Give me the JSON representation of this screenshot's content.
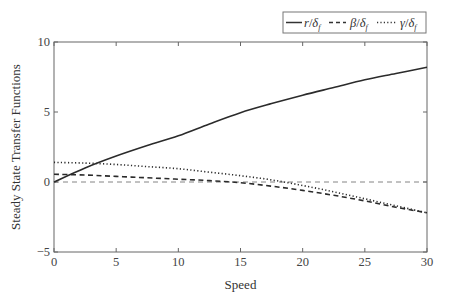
{
  "chart_data": {
    "type": "line",
    "title": "",
    "xlabel": "Speed",
    "ylabel": "Steady State Transfer Functions",
    "xlim": [
      0,
      30
    ],
    "ylim": [
      -5,
      10
    ],
    "xticks": [
      0,
      5,
      10,
      15,
      20,
      25,
      30
    ],
    "yticks": [
      -5,
      0,
      5,
      10
    ],
    "xtick_labels": [
      "0",
      "5",
      "10",
      "15",
      "20",
      "25",
      "30"
    ],
    "ytick_labels": [
      "−5",
      "0",
      "5",
      "10"
    ],
    "grid": false,
    "legend_position": "top-right, above plot",
    "reference_line": {
      "y": 0,
      "style": "dashed-thin"
    },
    "x": [
      0,
      2.5,
      5,
      7.5,
      10,
      12.5,
      15,
      17.5,
      20,
      22.5,
      25,
      27.5,
      30
    ],
    "series": [
      {
        "name": "r/δf",
        "style": "solid",
        "values": [
          0,
          1.0,
          1.85,
          2.6,
          3.3,
          4.15,
          4.95,
          5.6,
          6.2,
          6.75,
          7.3,
          7.75,
          8.2
        ]
      },
      {
        "name": "β/δf",
        "style": "dashed",
        "values": [
          0.55,
          0.5,
          0.4,
          0.3,
          0.2,
          0.1,
          -0.05,
          -0.3,
          -0.6,
          -0.95,
          -1.35,
          -1.8,
          -2.2
        ]
      },
      {
        "name": "γ/δf",
        "style": "dotted",
        "values": [
          1.4,
          1.35,
          1.25,
          1.1,
          0.95,
          0.7,
          0.45,
          0.15,
          -0.25,
          -0.7,
          -1.2,
          -1.7,
          -2.2
        ]
      }
    ]
  },
  "legend": {
    "items": [
      {
        "symbol": "r",
        "sub": "f",
        "label": "r/δf"
      },
      {
        "symbol": "β",
        "sub": "f",
        "label": "β/δf"
      },
      {
        "symbol": "γ",
        "sub": "f",
        "label": "γ/δf"
      }
    ]
  }
}
